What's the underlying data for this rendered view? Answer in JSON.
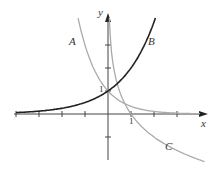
{
  "chart_data": {
    "type": "line",
    "title": "",
    "xlabel": "x",
    "ylabel": "y",
    "xlim": [
      -4,
      4.2
    ],
    "ylim": [
      -2,
      4.3
    ],
    "grid": false,
    "tick_labels": {
      "x": [
        "1"
      ],
      "y": [
        "1"
      ]
    },
    "x_ticks": [
      -4,
      -3,
      -2,
      -1,
      1,
      2,
      3
    ],
    "y_ticks": [
      -1,
      1,
      2,
      3
    ],
    "series": [
      {
        "name": "A",
        "description": "decreasing exponential, passes (0,1)",
        "color": "#aaaaaa",
        "x": [
          -1.3,
          -1,
          -0.5,
          0,
          0.5,
          1,
          2,
          3
        ],
        "values": [
          4.2,
          3,
          1.73,
          1,
          0.58,
          0.33,
          0.11,
          0.04
        ]
      },
      {
        "name": "B",
        "description": "increasing exponential, passes (0,1)",
        "color": "#222222",
        "x": [
          -4,
          -3,
          -2,
          -1,
          0,
          1,
          1.5,
          2.05
        ],
        "values": [
          0.06,
          0.13,
          0.25,
          0.5,
          1,
          2,
          2.83,
          4.15
        ]
      },
      {
        "name": "C",
        "description": "decreasing logarithm, passes (1,0)",
        "color": "#aaaaaa",
        "x": [
          0.06,
          0.1,
          0.25,
          0.5,
          1,
          2,
          3,
          4.2
        ],
        "values": [
          4.06,
          3.32,
          2,
          1,
          0,
          -1,
          -1.58,
          -2.07
        ]
      }
    ],
    "annotations": [
      {
        "text": "A",
        "x": -1.5,
        "y": 2.9
      },
      {
        "text": "B",
        "x": 1.85,
        "y": 2.9
      },
      {
        "text": "C",
        "x": 2.6,
        "y": -1.5
      }
    ]
  },
  "labels": {
    "x_axis": "x",
    "y_axis": "y",
    "one_x": "1",
    "one_y": "1",
    "A": "A",
    "B": "B",
    "C": "C"
  }
}
